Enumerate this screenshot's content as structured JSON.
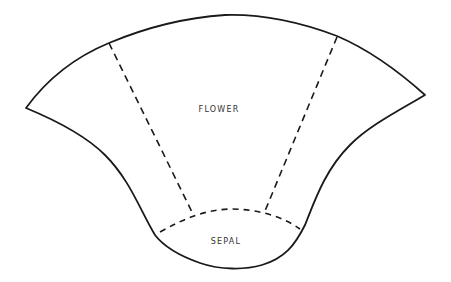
{
  "diagram": {
    "type": "pattern-template",
    "labels": {
      "flower": "FLOWER",
      "sepal": "SEPAL"
    },
    "colors": {
      "line": "#1a1a1a",
      "text": "#333333",
      "background": "#ffffff"
    },
    "regions": [
      {
        "name": "flower",
        "label": "FLOWER"
      },
      {
        "name": "sepal",
        "label": "SEPAL"
      }
    ]
  }
}
